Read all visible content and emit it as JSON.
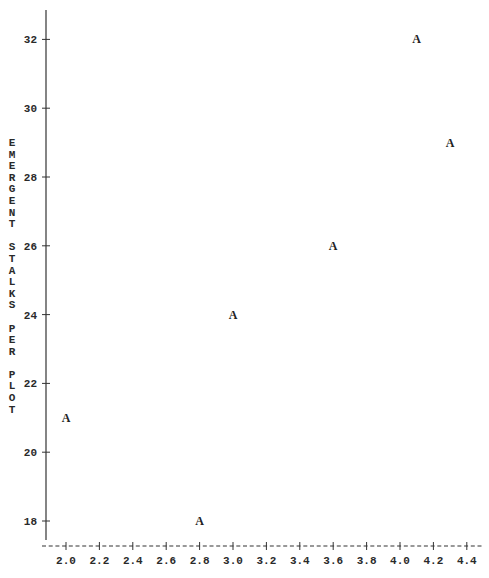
{
  "title_clipped": "...; 3 -1 , 199.",
  "chart_data": {
    "type": "scatter",
    "title": "",
    "xlabel": "",
    "ylabel": "EMERGENT STALKS PER PLOT",
    "marker": "A",
    "x_ticks": [
      "2.0",
      "2.2",
      "2.4",
      "2.6",
      "2.8",
      "3.0",
      "3.2",
      "3.4",
      "3.6",
      "3.8",
      "4.0",
      "4.2",
      "4.4"
    ],
    "y_ticks": [
      "18",
      "20",
      "22",
      "24",
      "26",
      "28",
      "30",
      "32"
    ],
    "xlim": [
      1.9,
      4.5
    ],
    "ylim": [
      17.4,
      32.8
    ],
    "grid": false,
    "legend": "none",
    "points": [
      {
        "x": 2.0,
        "y": 21
      },
      {
        "x": 2.8,
        "y": 18
      },
      {
        "x": 3.0,
        "y": 24
      },
      {
        "x": 3.6,
        "y": 26
      },
      {
        "x": 4.1,
        "y": 32
      },
      {
        "x": 4.3,
        "y": 29
      }
    ]
  }
}
